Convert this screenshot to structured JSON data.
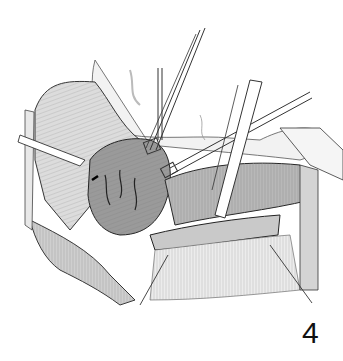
{
  "figure": {
    "label": "4",
    "colors": {
      "background": "#ffffff",
      "line": "#222222",
      "tissue_light": "#d8d8d8",
      "tissue_mid": "#a8a8a8",
      "tissue_dark": "#6e6e6e"
    }
  }
}
